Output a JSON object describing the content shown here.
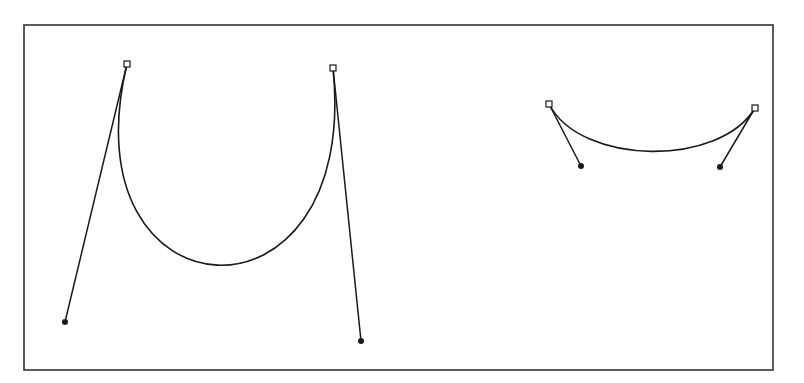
{
  "diagram": {
    "type": "bezier-curve-illustration",
    "stroke_color": "#1a1a1a",
    "background": "#ffffff",
    "frame": {
      "x1": 24,
      "y1": 25,
      "x2": 773,
      "y2": 370
    },
    "curves": [
      {
        "name": "long-handle-curve",
        "anchor_start": {
          "x": 127,
          "y": 64
        },
        "control_start": {
          "x": 65,
          "y": 322
        },
        "control_end": {
          "x": 361,
          "y": 341
        },
        "anchor_end": {
          "x": 333,
          "y": 68
        }
      },
      {
        "name": "short-handle-curve",
        "anchor_start": {
          "x": 549,
          "y": 104
        },
        "control_start": {
          "x": 581,
          "y": 166
        },
        "control_end": {
          "x": 720,
          "y": 167
        },
        "anchor_end": {
          "x": 755,
          "y": 108
        }
      }
    ]
  }
}
